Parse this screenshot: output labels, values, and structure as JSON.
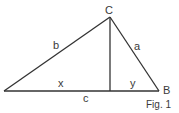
{
  "diagram": {
    "type": "right-triangle-altitude",
    "caption": "Fig. 1",
    "vertices": {
      "C": "C",
      "B": "B"
    },
    "sides": {
      "b": "b",
      "a": "a",
      "c": "c"
    },
    "segments": {
      "x": "x",
      "y": "y"
    },
    "colors": {
      "stroke": "#333333",
      "text": "#3a3a3a",
      "background": "#ffffff"
    }
  }
}
